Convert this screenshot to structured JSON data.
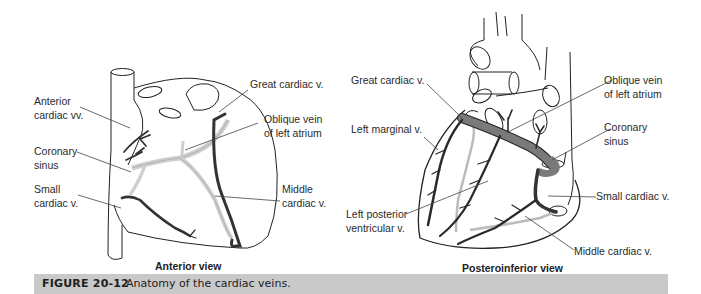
{
  "figure": {
    "number": "FIGURE 20-12",
    "caption": "Anatomy of the cardiac veins.",
    "caption_bar_color": "#c9c9c9"
  },
  "anterior_view": {
    "title": "Anterior view",
    "labels": {
      "great_cardiac_v": "Great cardiac v.",
      "anterior_cardiac_vv_line1": "Anterior",
      "anterior_cardiac_vv_line2": "cardiac vv.",
      "oblique_vein_line1": "Oblique vein",
      "oblique_vein_line2": "of left atrium",
      "coronary_sinus_line1": "Coronary",
      "coronary_sinus_line2": "sinus",
      "small_cardiac_v_line1": "Small",
      "small_cardiac_v_line2": "cardiac v.",
      "middle_cardiac_v_line1": "Middle",
      "middle_cardiac_v_line2": "cardiac v."
    }
  },
  "posteroinferior_view": {
    "title": "Posteroinferior view",
    "labels": {
      "great_cardiac_v": "Great cardiac v.",
      "left_marginal_v": "Left marginal v.",
      "left_posterior_ventricular_v_line1": "Left posterior",
      "left_posterior_ventricular_v_line2": "ventricular v.",
      "oblique_vein_line1": "Oblique vein",
      "oblique_vein_line2": "of left atrium",
      "coronary_sinus_line1": "Coronary",
      "coronary_sinus_line2": "sinus",
      "small_cardiac_v": "Small cardiac v.",
      "middle_cardiac_v": "Middle cardiac v."
    }
  },
  "colors": {
    "outline": "#222222",
    "vein_dark": "#555555",
    "vein_light": "#d4d4d4",
    "sinus_fill": "#7a7a7a"
  }
}
